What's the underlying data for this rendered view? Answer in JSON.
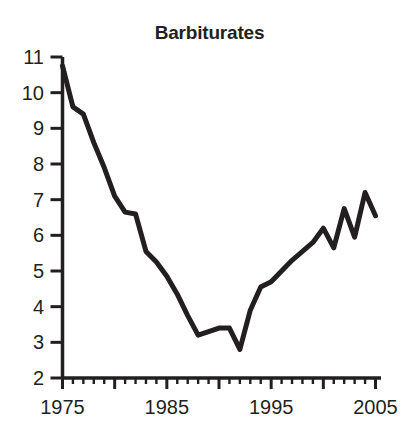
{
  "chart": {
    "title": "Barbiturates"
  },
  "chart_data": {
    "type": "line",
    "title": "Barbiturates",
    "xlabel": "",
    "ylabel": "",
    "xlim": [
      1975,
      2005.5
    ],
    "ylim": [
      2,
      11
    ],
    "grid": false,
    "legend": false,
    "line_color": "#231f20",
    "line_width": 5,
    "x_major_ticks": [
      1975,
      1980,
      1985,
      1990,
      1995,
      2000,
      2005
    ],
    "x_tick_labels": [
      "1975",
      "1985",
      "1995",
      "2005"
    ],
    "x_labeled_ticks": [
      1975,
      1985,
      1995,
      2005
    ],
    "x_minor_tick_step": 1,
    "y_ticks": [
      2,
      3,
      4,
      5,
      6,
      7,
      8,
      9,
      10,
      11
    ],
    "y_tick_labels": [
      "2",
      "3",
      "4",
      "5",
      "6",
      "7",
      "8",
      "9",
      "10",
      "11"
    ],
    "x": [
      1975,
      1976,
      1977,
      1978,
      1979,
      1980,
      1981,
      1982,
      1983,
      1984,
      1985,
      1986,
      1987,
      1988,
      1989,
      1990,
      1991,
      1992,
      1993,
      1994,
      1995,
      1996,
      1997,
      1998,
      1999,
      2000,
      2001,
      2002,
      2003,
      2004,
      2005
    ],
    "values": [
      10.75,
      9.6,
      9.4,
      8.6,
      7.9,
      7.1,
      6.65,
      6.6,
      5.55,
      5.25,
      4.85,
      4.35,
      3.75,
      3.2,
      3.3,
      3.4,
      3.4,
      2.8,
      3.9,
      4.55,
      4.7,
      5.0,
      5.3,
      5.55,
      5.8,
      6.2,
      5.65,
      6.75,
      5.95,
      7.2,
      6.55
    ]
  }
}
